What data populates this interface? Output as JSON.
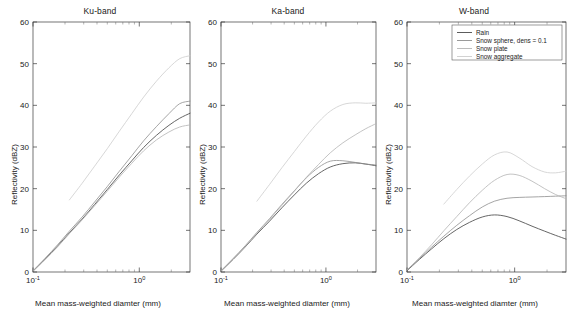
{
  "figure": {
    "width": 572,
    "height": 312,
    "background": "#ffffff"
  },
  "axis": {
    "ylabel": "Reflectivity (dBZ)",
    "xlabel": "Mean mass-weighted diamter (mm)",
    "yticks": [
      "0",
      "10",
      "20",
      "30",
      "40",
      "50",
      "60"
    ],
    "ylim": [
      0,
      60
    ],
    "xticks": [
      "10",
      "10"
    ],
    "xtick_exponents": [
      "-1",
      "0"
    ],
    "xlim": [
      0.1,
      3.0
    ],
    "xscale": "log",
    "grid": "off"
  },
  "legend": {
    "position": "upper-right-panel3",
    "entries": [
      {
        "label": "Rain",
        "color": "#4a4a4a"
      },
      {
        "label": "Snow sphere, dens = 0.1",
        "color": "#8e8e8e"
      },
      {
        "label": "Snow plate",
        "color": "#b4b4b4"
      },
      {
        "label": "Snow aggregate",
        "color": "#cdcdcd"
      }
    ]
  },
  "panels": [
    {
      "title": "Ku-band"
    },
    {
      "title": "Ka-band"
    },
    {
      "title": "W-band"
    }
  ],
  "chart_data": {
    "type": "line",
    "title": "",
    "xlabel": "Mean mass-weighted diamter (mm)",
    "ylabel": "Reflectivity (dBZ)",
    "xscale": "log",
    "xlim": [
      0.1,
      3.0
    ],
    "ylim": [
      0,
      60
    ],
    "yticks": [
      0,
      10,
      20,
      30,
      40,
      50,
      60
    ],
    "xticks": [
      0.1,
      1.0
    ],
    "x": [
      0.1,
      0.13,
      0.17,
      0.22,
      0.29,
      0.38,
      0.5,
      0.65,
      0.85,
      1.1,
      1.45,
      1.9,
      2.4,
      3.0
    ],
    "subplots": [
      {
        "title": "Ku-band",
        "series": [
          {
            "name": "Rain",
            "color": "#4a4a4a",
            "values": [
              0.2,
              3.1,
              6.2,
              9.4,
              12.7,
              16.2,
              19.8,
              23.3,
              26.7,
              29.9,
              32.8,
              35.2,
              36.9,
              38.1
            ]
          },
          {
            "name": "Snow sphere, dens = 0.1",
            "color": "#8e8e8e",
            "values": [
              0.3,
              3.3,
              6.5,
              9.8,
              13.2,
              16.8,
              20.5,
              24.2,
              27.9,
              31.5,
              34.9,
              38.0,
              40.4,
              41.0
            ]
          },
          {
            "name": "Snow plate",
            "color": "#b4b4b4",
            "values": [
              0.2,
              3.0,
              6.0,
              9.2,
              12.5,
              15.9,
              19.4,
              22.8,
              26.1,
              29.1,
              31.7,
              33.6,
              34.8,
              35.3
            ]
          },
          {
            "name": "Snow aggregate",
            "color": "#cdcdcd",
            "values": [
              null,
              null,
              null,
              17.3,
              21.3,
              25.4,
              29.6,
              33.8,
              38.0,
              42.0,
              45.8,
              49.0,
              51.2,
              51.9
            ]
          }
        ]
      },
      {
        "title": "Ka-band",
        "series": [
          {
            "name": "Rain",
            "color": "#4a4a4a",
            "values": [
              0.2,
              3.0,
              6.0,
              9.1,
              12.2,
              15.4,
              18.5,
              21.3,
              23.6,
              25.2,
              26.0,
              26.2,
              25.9,
              25.5
            ]
          },
          {
            "name": "Snow sphere, dens = 0.1",
            "color": "#8e8e8e",
            "values": [
              0.3,
              3.2,
              6.3,
              9.5,
              12.8,
              16.2,
              19.5,
              22.6,
              25.1,
              26.6,
              26.7,
              26.3,
              25.9,
              25.7
            ]
          },
          {
            "name": "Snow plate",
            "color": "#b4b4b4",
            "values": [
              0.2,
              3.0,
              6.1,
              9.3,
              12.6,
              16.0,
              19.4,
              22.7,
              25.8,
              28.6,
              31.0,
              32.9,
              34.4,
              35.6
            ]
          },
          {
            "name": "Snow aggregate",
            "color": "#cdcdcd",
            "values": [
              null,
              null,
              null,
              17.0,
              21.0,
              25.0,
              28.9,
              32.6,
              36.0,
              38.6,
              40.2,
              40.6,
              40.5,
              40.6
            ]
          }
        ]
      },
      {
        "title": "W-band",
        "series": [
          {
            "name": "Rain",
            "color": "#4a4a4a",
            "values": [
              0.3,
              3.0,
              5.6,
              8.0,
              10.2,
              11.9,
              13.2,
              13.7,
              13.3,
              12.3,
              11.0,
              9.8,
              8.8,
              7.9
            ]
          },
          {
            "name": "Snow sphere, dens = 0.1",
            "color": "#8e8e8e",
            "values": [
              0.5,
              3.2,
              6.0,
              8.6,
              11.2,
              13.5,
              15.6,
              17.0,
              17.7,
              17.9,
              18.0,
              18.1,
              18.2,
              18.3
            ]
          },
          {
            "name": "Snow plate",
            "color": "#b4b4b4",
            "values": [
              0.4,
              3.4,
              6.6,
              9.9,
              13.3,
              16.6,
              19.6,
              22.0,
              23.4,
              23.2,
              21.8,
              20.0,
              18.6,
              17.6
            ]
          },
          {
            "name": "Snow aggregate",
            "color": "#cdcdcd",
            "values": [
              null,
              null,
              null,
              16.3,
              19.8,
              23.0,
              25.9,
              28.1,
              28.8,
              27.4,
              25.3,
              24.0,
              23.8,
              24.2
            ]
          }
        ]
      }
    ]
  }
}
